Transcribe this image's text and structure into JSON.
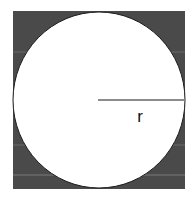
{
  "diagram": {
    "radius_label": "r",
    "colors": {
      "square_fill": "#4a4a4a",
      "circle_fill": "#ffffff",
      "stroke": "#1a1a1a",
      "background": "#ffffff"
    }
  }
}
